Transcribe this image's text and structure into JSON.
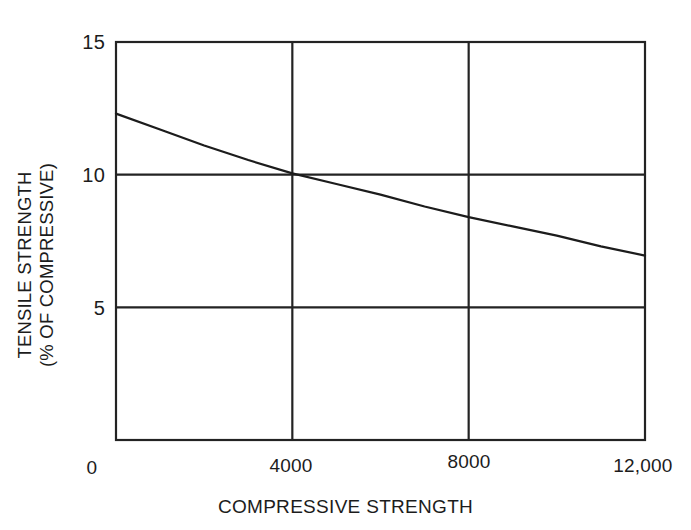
{
  "chart_data": {
    "type": "line",
    "title": "",
    "subtitle": "",
    "xlabel": "COMPRESSIVE STRENGTH",
    "ylabel_line1": "TENSILE STRENGTH",
    "ylabel_line2": "(% OF COMPRESSIVE)",
    "xlim": [
      0,
      12000
    ],
    "ylim": [
      0,
      15
    ],
    "xticks": [
      0,
      4000,
      8000,
      12000
    ],
    "xtick_labels": [
      "0",
      "4000",
      "8000",
      "12,000"
    ],
    "yticks": [
      5,
      10,
      15
    ],
    "ytick_labels": [
      "5",
      "10",
      "15"
    ],
    "grid": true,
    "gridlines_x": [
      4000,
      8000
    ],
    "gridlines_y": [
      5,
      10
    ],
    "legend": null,
    "legend_position": "none",
    "series": [
      {
        "name": "tensile strength vs compressive strength",
        "x": [
          0,
          1000,
          2000,
          3000,
          4000,
          5000,
          6000,
          7000,
          8000,
          9000,
          10000,
          11000,
          12000
        ],
        "y": [
          12.3,
          11.7,
          11.1,
          10.55,
          10.05,
          9.65,
          9.25,
          8.8,
          8.4,
          8.05,
          7.7,
          7.3,
          6.95
        ]
      }
    ],
    "line_color": "#1c1c1c",
    "frame_color": "#232323",
    "background_color": "#ffffff"
  },
  "geometry": {
    "plot_left": 116,
    "plot_right": 645,
    "plot_top": 42,
    "plot_bottom": 440
  }
}
